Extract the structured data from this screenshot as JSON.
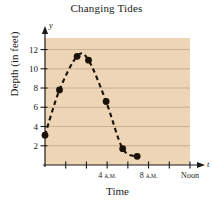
{
  "chart_data": {
    "type": "scatter",
    "title": "Changing Tides",
    "xlabel": "Time",
    "ylabel": "Depth (in feet)",
    "axis_var_x": "t",
    "axis_var_y": "y",
    "xlim": [
      0,
      14
    ],
    "ylim": [
      0,
      13.2
    ],
    "grid": true,
    "legend": "none",
    "plot_background": "#edd5b5",
    "marker_color": "#1a1208",
    "curve_style": "dashed",
    "yticks": [
      2,
      4,
      6,
      8,
      10,
      12
    ],
    "ytick_labels": [
      "2",
      "4",
      "6",
      "8",
      "10",
      "12"
    ],
    "xticks": [
      1,
      2,
      3,
      4,
      5,
      6,
      7
    ],
    "xtick_labels": [
      "",
      "",
      "4 A.M.",
      "",
      "8 A.M.",
      "",
      "Noon"
    ],
    "xtick_labeled": [
      {
        "index": 2,
        "big": "4",
        "small": "A.M."
      },
      {
        "index": 4,
        "big": "8",
        "small": "A.M."
      },
      {
        "index": 6,
        "big": "Noon",
        "small": ""
      }
    ],
    "points": [
      {
        "x": 0.0,
        "y": 3.1
      },
      {
        "x": 1.4,
        "y": 7.8
      },
      {
        "x": 3.1,
        "y": 11.3
      },
      {
        "x": 4.2,
        "y": 10.9
      },
      {
        "x": 5.9,
        "y": 6.6
      },
      {
        "x": 7.5,
        "y": 1.7
      },
      {
        "x": 8.9,
        "y": 0.9
      }
    ]
  }
}
